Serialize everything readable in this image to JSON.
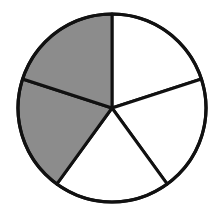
{
  "diagram": {
    "type": "fraction-circle",
    "total_parts": 5,
    "shaded_parts": 2,
    "fraction": "2/5",
    "colors": {
      "background": "#ffffff",
      "shaded_fill": "#8c8c8c",
      "unshaded_fill": "#ffffff",
      "stroke": "#111111"
    },
    "slices": [
      {
        "index": 0,
        "position": "top-right",
        "shaded": false
      },
      {
        "index": 1,
        "position": "right",
        "shaded": false
      },
      {
        "index": 2,
        "position": "bottom",
        "shaded": false
      },
      {
        "index": 3,
        "position": "left",
        "shaded": true
      },
      {
        "index": 4,
        "position": "top-left",
        "shaded": true
      }
    ]
  }
}
